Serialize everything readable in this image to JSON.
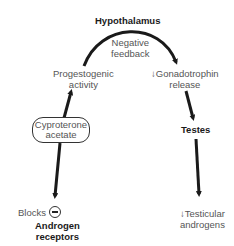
{
  "diagram": {
    "title_node": "Hypothalamus",
    "nodes": {
      "hypothalamus": "Hypothalamus",
      "negative_feedback_line1": "Negative",
      "negative_feedback_line2": "feedback",
      "progestogenic_line1": "Progestogenic",
      "progestogenic_line2": "activity",
      "gonadotrophin_line1": "↓Gonadotrophin",
      "gonadotrophin_line2": "release",
      "drug_line1": "Cyproterone",
      "drug_line2": "acetate",
      "testes": "Testes",
      "blocks": "Blocks",
      "receptors_line1": "Androgen",
      "receptors_line2": "receptors",
      "testicular_line1": "↓Testicular",
      "testicular_line2": "androgens"
    },
    "icons": {
      "inhibit": "minus-circle-icon"
    },
    "colors": {
      "arrow": "#1a1a1a",
      "text": "#555555",
      "bold_text": "#1a1a1a"
    }
  }
}
